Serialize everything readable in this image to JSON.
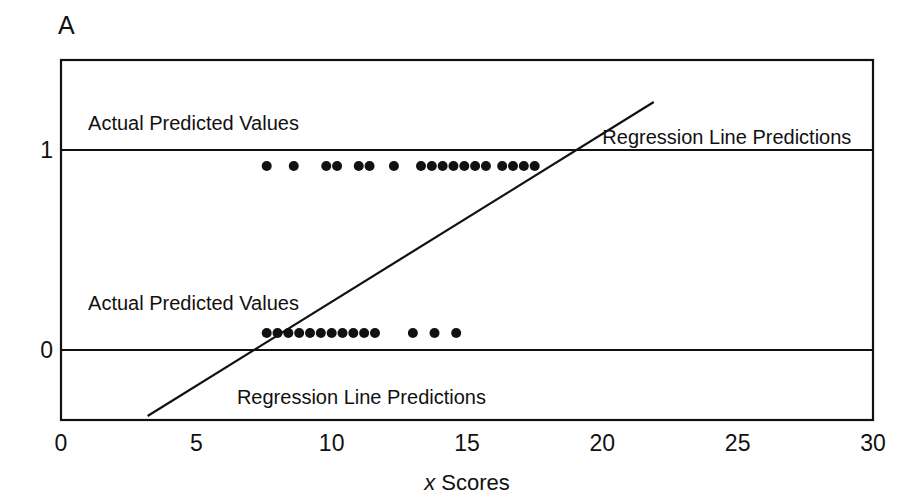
{
  "panel": {
    "letter": "A"
  },
  "chart_data": {
    "type": "scatter",
    "title": "",
    "subtitle": "",
    "xlabel": "x Scores",
    "xlabel_italic_part": "x",
    "xlabel_rest": " Scores",
    "ylabel": "",
    "xlim": [
      0,
      30
    ],
    "ylim": [
      -0.35,
      1.45
    ],
    "grid": false,
    "legend_position": "none",
    "xticks": [
      0,
      5,
      10,
      15,
      20,
      25,
      30
    ],
    "xticklabels": [
      "0",
      "5",
      "10",
      "15",
      "20",
      "25",
      "30"
    ],
    "yticks": [
      0,
      1
    ],
    "yticklabels": [
      "0",
      "1"
    ],
    "series": [
      {
        "name": "Actual values y = 1",
        "marker": "filled-circle",
        "color": "#111111",
        "y": 0.92,
        "x": [
          7.6,
          8.6,
          9.8,
          10.2,
          11.0,
          11.4,
          12.3,
          13.3,
          13.7,
          14.1,
          14.5,
          14.9,
          15.3,
          15.7,
          16.3,
          16.7,
          17.1,
          17.5
        ]
      },
      {
        "name": "Actual values y = 0",
        "marker": "filled-circle",
        "color": "#111111",
        "y": 0.085,
        "x": [
          7.6,
          8.0,
          8.4,
          8.8,
          9.2,
          9.6,
          10.0,
          10.4,
          10.8,
          11.2,
          11.6,
          13.0,
          13.8,
          14.6
        ]
      }
    ],
    "reference_lines": [
      {
        "name": "actual-values-line-upper",
        "y": 1,
        "from_x": 0,
        "to_x": 30,
        "color": "#111111"
      },
      {
        "name": "actual-values-line-lower",
        "y": 0,
        "from_x": 0,
        "to_x": 30,
        "color": "#111111"
      }
    ],
    "regression_line": {
      "name": "regression-line",
      "color": "#111111",
      "x0": 3.2,
      "y0": -0.33,
      "x1": 21.9,
      "y1": 1.24
    },
    "annotations": [
      {
        "name": "annot-actual-upper",
        "text": "Actual Predicted Values",
        "x": 1.0,
        "y": 1.13
      },
      {
        "name": "annot-regression-upper",
        "text": "Regression Line Predictions",
        "x": 20.0,
        "y": 1.06
      },
      {
        "name": "annot-actual-lower",
        "text": "Actual Predicted Values",
        "x": 1.0,
        "y": 0.23
      },
      {
        "name": "annot-regression-lower",
        "text": "Regression Line Predictions",
        "x": 6.5,
        "y": -0.24
      }
    ]
  }
}
